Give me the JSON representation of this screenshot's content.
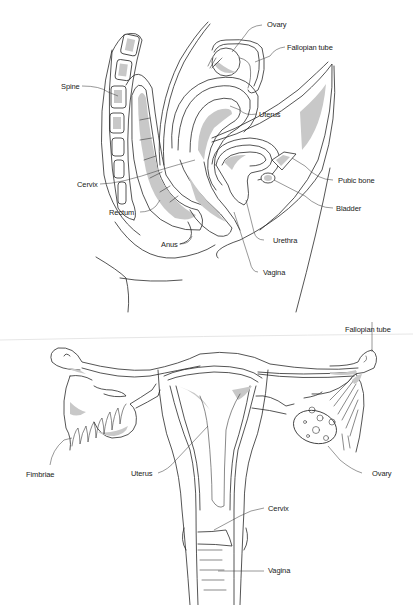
{
  "figure": {
    "panels": [
      {
        "id": "sagittal",
        "view": "side cross-section",
        "labels": {
          "ovary": "Ovary",
          "fallopian_tube": "Fallopian tube",
          "spine": "Spine",
          "uterus": "Uterus",
          "cervix": "Cervix",
          "pubic_bone": "Pubic bone",
          "rectum": "Rectum",
          "bladder": "Bladder",
          "anus": "Anus",
          "urethra": "Urethra",
          "vagina": "Vagina"
        }
      },
      {
        "id": "frontal",
        "view": "front view",
        "labels": {
          "fallopian_tube": "Fallopian tube",
          "fimbriae": "Fimbriae",
          "uterus": "Uterus",
          "ovary": "Ovary",
          "cervix": "Cervix",
          "vagina": "Vagina"
        }
      }
    ],
    "colors": {
      "line": "#2a2a2a",
      "shade": "#c8c8c8",
      "background": "#ffffff"
    }
  }
}
